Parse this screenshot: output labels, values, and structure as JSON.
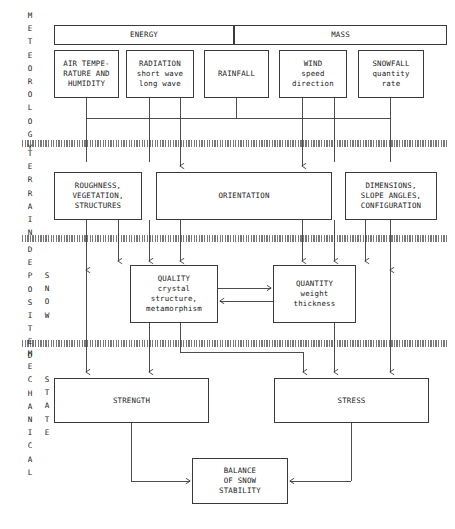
{
  "diagram": {
    "band_labels": [
      {
        "name": "meteorology",
        "text": "METEOROLOGY",
        "x": 26,
        "y": 12
      },
      {
        "name": "terrain",
        "text": "TERRAIN",
        "x": 26,
        "y": 142
      },
      {
        "name": "deposited",
        "text": "DEPOSITED",
        "x": 26,
        "y": 243
      },
      {
        "name": "snow",
        "text": "SNOW",
        "x": 45,
        "y": 269
      },
      {
        "name": "mechanical",
        "text": "MECHANICAL",
        "x": 26,
        "y": 348
      },
      {
        "name": "state",
        "text": "STATE",
        "x": 45,
        "y": 387
      }
    ],
    "group_boxes": [
      {
        "name": "energy",
        "label": "ENERGY",
        "x": 54,
        "y": 25,
        "w": 180,
        "h": 20
      },
      {
        "name": "mass",
        "label": "MASS",
        "x": 234,
        "y": 25,
        "w": 213,
        "h": 20
      }
    ],
    "meteorology_boxes": [
      {
        "name": "air-temperature-humidity",
        "label": "AIR TEMPE-\nRATURE AND\nHUMIDITY",
        "x": 54,
        "y": 50,
        "w": 65,
        "h": 48
      },
      {
        "name": "radiation",
        "label": "RADIATION\nshort wave\nlong wave",
        "x": 126,
        "y": 50,
        "w": 68,
        "h": 48
      },
      {
        "name": "rainfall",
        "label": "RAINFALL",
        "x": 204,
        "y": 50,
        "w": 65,
        "h": 48
      },
      {
        "name": "wind",
        "label": "WIND\nspeed\ndirection",
        "x": 279,
        "y": 50,
        "w": 68,
        "h": 48
      },
      {
        "name": "snowfall",
        "label": "SNOWFALL\nquantity\nrate",
        "x": 358,
        "y": 50,
        "w": 66,
        "h": 48
      }
    ],
    "terrain_boxes": [
      {
        "name": "roughness-vegetation-structures",
        "label": "ROUGHNESS,\nVEGETATION,\nSTRUCTURES",
        "x": 54,
        "y": 172,
        "w": 88,
        "h": 48
      },
      {
        "name": "orientation",
        "label": "ORIENTATION",
        "x": 156,
        "y": 172,
        "w": 176,
        "h": 48
      },
      {
        "name": "dimensions-slope-configuration",
        "label": "DIMENSIONS,\nSLOPE ANGLES,\nCONFIGURATION",
        "x": 345,
        "y": 172,
        "w": 92,
        "h": 48
      }
    ],
    "snow_boxes": [
      {
        "name": "quality",
        "label": "QUALITY\ncrystal\nstructure,\nmetamorphism",
        "x": 130,
        "y": 265,
        "w": 88,
        "h": 58
      },
      {
        "name": "quantity",
        "label": "QUANTITY\nweight\nthickness",
        "x": 273,
        "y": 265,
        "w": 83,
        "h": 58
      }
    ],
    "mechanical_boxes": [
      {
        "name": "strength",
        "label": "STRENGTH",
        "x": 54,
        "y": 378,
        "w": 155,
        "h": 45
      },
      {
        "name": "stress",
        "label": "STRESS",
        "x": 274,
        "y": 378,
        "w": 155,
        "h": 45
      }
    ],
    "result_box": {
      "name": "balance-of-snow-stability",
      "label": "BALANCE\nOF SNOW\nSTABILITY",
      "x": 192,
      "y": 458,
      "w": 96,
      "h": 46
    },
    "dividers": [
      {
        "name": "divider-meteorology-terrain",
        "y": 143
      },
      {
        "name": "divider-terrain-deposited",
        "y": 238
      },
      {
        "name": "divider-deposited-mechanical",
        "y": 343
      }
    ],
    "colors": {
      "line": "#3a3a3a",
      "divider": "#6e6e6e",
      "background": "#ffffff",
      "text": "#1a1a1a"
    }
  }
}
